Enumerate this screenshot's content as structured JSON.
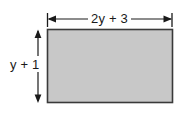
{
  "figure": {
    "type": "geometry-diagram",
    "shape": "rectangle",
    "background_color": "#ffffff",
    "rectangle": {
      "fill_color": "#c8c8c8",
      "stroke_color": "#3a3a3a",
      "x": 47,
      "y": 29,
      "width": 126,
      "height": 74
    },
    "dimensions": {
      "width_label": "2y + 3",
      "height_label": "y + 1"
    },
    "annotations": {
      "line_color": "#1a1a1a",
      "text_color": "#1a1a1a"
    }
  }
}
